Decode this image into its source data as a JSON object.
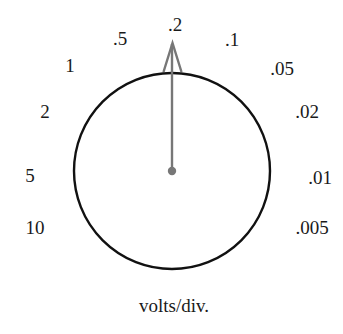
{
  "dial": {
    "caption": "volts/div.",
    "selected": ".2",
    "labels": {
      "l10": "10",
      "l5": "5",
      "l2": "2",
      "l1": "1",
      "l05": ".5",
      "l02": ".2",
      "l01": ".1",
      "l005": ".05",
      "l002": ".02",
      "l001": ".01",
      "l0005": ".005"
    },
    "colors": {
      "circle": "#111111",
      "pointer": "#777777",
      "text": "#1a1a1a"
    }
  }
}
